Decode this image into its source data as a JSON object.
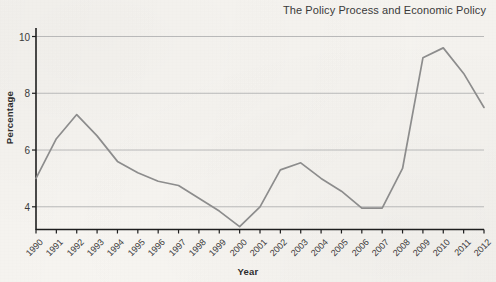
{
  "chart_data": {
    "type": "line",
    "title": "The Policy Process and Economic Policy",
    "xlabel": "Year",
    "ylabel": "Percentage",
    "grid": true,
    "legend": "none",
    "xlim": [
      1990,
      2012
    ],
    "ylim": [
      3.2,
      10.3
    ],
    "ytick_labels": [
      "4",
      "6",
      "8",
      "10"
    ],
    "yticks": [
      4,
      6,
      8,
      10
    ],
    "categories": [
      "1990",
      "1991",
      "1992",
      "1993",
      "1994",
      "1995",
      "1996",
      "1997",
      "1998",
      "1999",
      "2000",
      "2001",
      "2002",
      "2003",
      "2004",
      "2005",
      "2006",
      "2007",
      "2008",
      "2009",
      "2010",
      "2011",
      "2012"
    ],
    "x": [
      1990,
      1991,
      1992,
      1993,
      1994,
      1995,
      1996,
      1997,
      1998,
      1999,
      2000,
      2001,
      2002,
      2003,
      2004,
      2005,
      2006,
      2007,
      2008,
      2009,
      2010,
      2011,
      2012
    ],
    "values": [
      5.0,
      6.4,
      7.25,
      6.5,
      5.6,
      5.2,
      4.9,
      4.75,
      4.3,
      3.85,
      3.3,
      4.0,
      5.3,
      5.55,
      5.0,
      4.55,
      3.95,
      3.95,
      5.35,
      9.25,
      9.6,
      8.7,
      7.5
    ],
    "series": [
      {
        "name": "Unemployment rate",
        "values": [
          5.0,
          6.4,
          7.25,
          6.5,
          5.6,
          5.2,
          4.9,
          4.75,
          4.3,
          3.85,
          3.3,
          4.0,
          5.3,
          5.55,
          5.0,
          4.55,
          3.95,
          3.95,
          5.35,
          9.25,
          9.6,
          8.7,
          7.5
        ]
      }
    ]
  },
  "style": {
    "line_color": "#8d8d8d",
    "grid_color": "#b9b9b9",
    "axis_color": "#1e1e1e",
    "text_color": "#3a3a3a",
    "background": "#f7f5f1"
  }
}
